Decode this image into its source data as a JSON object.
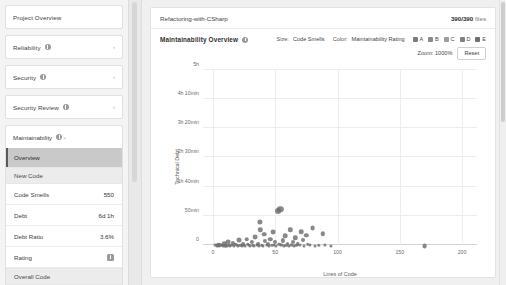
{
  "sidebar": {
    "project_overview": "Project Overview",
    "nav": [
      {
        "label": "Reliability",
        "icon": "info-icon",
        "chevron": "›"
      },
      {
        "label": "Security",
        "icon": "info-icon",
        "chevron": "›"
      },
      {
        "label": "Security Review",
        "icon": "info-icon",
        "chevron": "›"
      }
    ],
    "maintainability": {
      "label": "Maintainability",
      "chevron": "⌄",
      "selected_item": "Overview",
      "section_header": "New Code",
      "metrics": [
        {
          "label": "Code Smells",
          "value": "550"
        },
        {
          "label": "Debt",
          "value": "6d 1h"
        },
        {
          "label": "Debt Ratio",
          "value": "3.6%"
        },
        {
          "label": "Rating",
          "value": "A"
        }
      ],
      "footer_section": "Overall Code"
    }
  },
  "header": {
    "breadcrumb": "Refactoring-with-CSharp",
    "files_count": "390/390",
    "files_label": "files"
  },
  "chart_panel": {
    "title": "Maintainability Overview",
    "size_key": "Size:",
    "size_value": "Code Smells",
    "color_key": "Color:",
    "color_value": "Maintainability Rating",
    "zoom_label": "Zoom: 1000%",
    "reset_label": "Reset",
    "legend": [
      {
        "label": "A",
        "color": "#7b7b7b"
      },
      {
        "label": "B",
        "color": "#8a8a8a"
      },
      {
        "label": "C",
        "color": "#9d9d9d"
      },
      {
        "label": "D",
        "color": "#808080"
      },
      {
        "label": "E",
        "color": "#6f6f6f"
      }
    ]
  },
  "chart_data": {
    "type": "scatter",
    "title": "Maintainability Overview",
    "xlabel": "Lines of Code",
    "ylabel": "Technical Debt",
    "xlim": [
      -8,
      212
    ],
    "ylim": [
      0,
      300
    ],
    "xticks": [
      0,
      50,
      100,
      150,
      200
    ],
    "xticklabels": [
      "0",
      "50",
      "100",
      "150",
      "200"
    ],
    "yticks": [
      0,
      50,
      100,
      150,
      200,
      250,
      300
    ],
    "yticklabels": [
      "0",
      "50min",
      "1h 40min",
      "2h 30min",
      "3h 20min",
      "4h 10min",
      "5h"
    ],
    "grid": true,
    "legend_position": "top-right",
    "point_color": "#6e6e6e",
    "points": [
      {
        "x": 2,
        "y": 2,
        "r": 1.6
      },
      {
        "x": 3,
        "y": 1,
        "r": 1.5
      },
      {
        "x": 4,
        "y": 3,
        "r": 1.8
      },
      {
        "x": 5,
        "y": 1,
        "r": 1.5
      },
      {
        "x": 6,
        "y": 4,
        "r": 2.0
      },
      {
        "x": 7,
        "y": 2,
        "r": 1.6
      },
      {
        "x": 8,
        "y": 1,
        "r": 1.5
      },
      {
        "x": 9,
        "y": 6,
        "r": 2.2
      },
      {
        "x": 10,
        "y": 2,
        "r": 1.7
      },
      {
        "x": 11,
        "y": 1,
        "r": 1.5
      },
      {
        "x": 12,
        "y": 9,
        "r": 2.4
      },
      {
        "x": 13,
        "y": 3,
        "r": 1.7
      },
      {
        "x": 14,
        "y": 1,
        "r": 1.5
      },
      {
        "x": 15,
        "y": 2,
        "r": 1.6
      },
      {
        "x": 16,
        "y": 7,
        "r": 2.1
      },
      {
        "x": 17,
        "y": 1,
        "r": 1.5
      },
      {
        "x": 18,
        "y": 4,
        "r": 1.8
      },
      {
        "x": 19,
        "y": 2,
        "r": 1.6
      },
      {
        "x": 20,
        "y": 1,
        "r": 1.5
      },
      {
        "x": 21,
        "y": 12,
        "r": 2.5
      },
      {
        "x": 22,
        "y": 3,
        "r": 1.7
      },
      {
        "x": 23,
        "y": 1,
        "r": 1.5
      },
      {
        "x": 24,
        "y": 6,
        "r": 2.0
      },
      {
        "x": 25,
        "y": 2,
        "r": 1.6
      },
      {
        "x": 26,
        "y": 1,
        "r": 1.5
      },
      {
        "x": 27,
        "y": 14,
        "r": 2.3
      },
      {
        "x": 28,
        "y": 4,
        "r": 1.8
      },
      {
        "x": 29,
        "y": 2,
        "r": 1.6
      },
      {
        "x": 30,
        "y": 1,
        "r": 1.5
      },
      {
        "x": 31,
        "y": 8,
        "r": 2.1
      },
      {
        "x": 32,
        "y": 3,
        "r": 1.7
      },
      {
        "x": 33,
        "y": 1,
        "r": 1.5
      },
      {
        "x": 34,
        "y": 18,
        "r": 2.4
      },
      {
        "x": 35,
        "y": 2,
        "r": 1.6
      },
      {
        "x": 36,
        "y": 5,
        "r": 1.9
      },
      {
        "x": 37,
        "y": 1,
        "r": 1.5
      },
      {
        "x": 38,
        "y": 30,
        "r": 2.2
      },
      {
        "x": 38,
        "y": 44,
        "r": 2.6
      },
      {
        "x": 39,
        "y": 3,
        "r": 1.7
      },
      {
        "x": 40,
        "y": 1,
        "r": 1.5
      },
      {
        "x": 41,
        "y": 22,
        "r": 2.3
      },
      {
        "x": 42,
        "y": 10,
        "r": 2.1
      },
      {
        "x": 43,
        "y": 2,
        "r": 1.6
      },
      {
        "x": 44,
        "y": 6,
        "r": 2.0
      },
      {
        "x": 45,
        "y": 1,
        "r": 1.5
      },
      {
        "x": 46,
        "y": 14,
        "r": 2.2
      },
      {
        "x": 47,
        "y": 3,
        "r": 1.7
      },
      {
        "x": 48,
        "y": 26,
        "r": 2.4
      },
      {
        "x": 49,
        "y": 2,
        "r": 1.6
      },
      {
        "x": 50,
        "y": 8,
        "r": 2.0
      },
      {
        "x": 51,
        "y": 1,
        "r": 1.5
      },
      {
        "x": 52,
        "y": 63,
        "r": 3.0
      },
      {
        "x": 54,
        "y": 67,
        "r": 3.2
      },
      {
        "x": 53,
        "y": 4,
        "r": 1.8
      },
      {
        "x": 55,
        "y": 2,
        "r": 1.6
      },
      {
        "x": 56,
        "y": 11,
        "r": 2.1
      },
      {
        "x": 57,
        "y": 1,
        "r": 1.5
      },
      {
        "x": 58,
        "y": 20,
        "r": 2.3
      },
      {
        "x": 59,
        "y": 3,
        "r": 1.7
      },
      {
        "x": 60,
        "y": 6,
        "r": 1.9
      },
      {
        "x": 61,
        "y": 1,
        "r": 1.5
      },
      {
        "x": 62,
        "y": 30,
        "r": 2.2
      },
      {
        "x": 63,
        "y": 2,
        "r": 1.6
      },
      {
        "x": 64,
        "y": 9,
        "r": 2.0
      },
      {
        "x": 65,
        "y": 1,
        "r": 1.5
      },
      {
        "x": 66,
        "y": 16,
        "r": 2.2
      },
      {
        "x": 67,
        "y": 3,
        "r": 1.7
      },
      {
        "x": 68,
        "y": 5,
        "r": 1.8
      },
      {
        "x": 70,
        "y": 2,
        "r": 1.6
      },
      {
        "x": 71,
        "y": 27,
        "r": 2.3
      },
      {
        "x": 72,
        "y": 12,
        "r": 2.0
      },
      {
        "x": 73,
        "y": 1,
        "r": 1.5
      },
      {
        "x": 75,
        "y": 21,
        "r": 2.2
      },
      {
        "x": 76,
        "y": 4,
        "r": 1.8
      },
      {
        "x": 78,
        "y": 2,
        "r": 1.6
      },
      {
        "x": 80,
        "y": 34,
        "r": 2.4
      },
      {
        "x": 82,
        "y": 1,
        "r": 1.5
      },
      {
        "x": 85,
        "y": 3,
        "r": 1.7
      },
      {
        "x": 88,
        "y": 23,
        "r": 2.2
      },
      {
        "x": 90,
        "y": 2,
        "r": 1.6
      },
      {
        "x": 95,
        "y": 1,
        "r": 1.6
      },
      {
        "x": 170,
        "y": 3,
        "r": 2.4
      }
    ]
  }
}
